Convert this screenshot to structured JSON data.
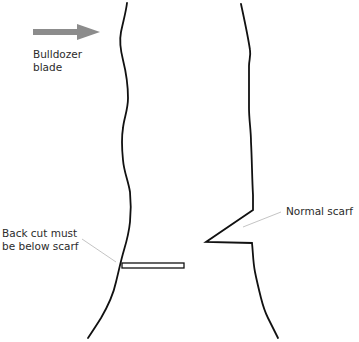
{
  "diagram": {
    "labels": {
      "bulldozer_line1": "Bulldozer",
      "bulldozer_line2": "blade",
      "backcut_line1": "Back cut must",
      "backcut_line2": "be below scarf",
      "scarf": "Normal scarf"
    },
    "arrow": {
      "direction": "right",
      "color": "#8c8c8c"
    },
    "colors": {
      "outline": "#111111",
      "leader_line": "#bdbdbd",
      "text": "#2b2b2b"
    }
  }
}
